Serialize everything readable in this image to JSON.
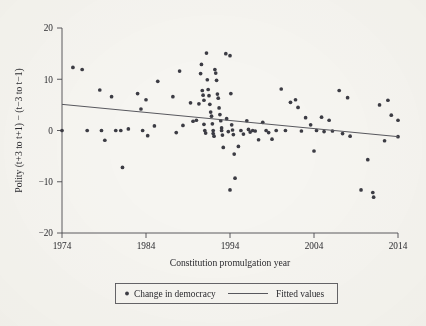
{
  "chart_data": {
    "type": "scatter",
    "title": "",
    "xlabel": "Constitution promulgation year",
    "ylabel": "Polity (t+3 to t+1) − (t−3 to t−1)",
    "xlim": [
      1974,
      2014
    ],
    "ylim": [
      -20,
      20
    ],
    "xticks": [
      1974,
      1984,
      1994,
      2004,
      2014
    ],
    "xtick_labels": [
      "1974",
      "1984",
      "1994",
      "2004",
      "2014"
    ],
    "yticks": [
      -20,
      -10,
      0,
      10,
      20
    ],
    "ytick_labels": [
      "−20",
      "−10",
      "0",
      "10",
      "20"
    ],
    "grid": false,
    "legend_position": "bottom-outside",
    "series": [
      {
        "name": "Change in democracy",
        "type": "scatter",
        "marker": "circle",
        "color": "#3c3c44",
        "points": [
          [
            1974.0,
            0.0
          ],
          [
            1975.3,
            12.3
          ],
          [
            1976.4,
            11.9
          ],
          [
            1977.0,
            0.0
          ],
          [
            1978.5,
            7.9
          ],
          [
            1978.7,
            0.0
          ],
          [
            1979.1,
            -1.9
          ],
          [
            1979.9,
            6.6
          ],
          [
            1980.4,
            0.0
          ],
          [
            1981.0,
            0.0
          ],
          [
            1981.2,
            -7.2
          ],
          [
            1981.9,
            0.3
          ],
          [
            1983.0,
            7.2
          ],
          [
            1983.4,
            4.2
          ],
          [
            1983.6,
            0.0
          ],
          [
            1984.0,
            6.0
          ],
          [
            1984.2,
            -1.0
          ],
          [
            1985.0,
            0.9
          ],
          [
            1985.4,
            9.6
          ],
          [
            1987.2,
            6.6
          ],
          [
            1987.6,
            -0.4
          ],
          [
            1988.0,
            11.6
          ],
          [
            1988.4,
            1.0
          ],
          [
            1989.3,
            5.4
          ],
          [
            1989.6,
            1.8
          ],
          [
            1990.0,
            2.0
          ],
          [
            1990.3,
            5.2
          ],
          [
            1990.5,
            11.1
          ],
          [
            1990.6,
            12.9
          ],
          [
            1990.7,
            7.8
          ],
          [
            1990.8,
            6.9
          ],
          [
            1990.9,
            5.9
          ],
          [
            1990.9,
            1.2
          ],
          [
            1991.0,
            0.0
          ],
          [
            1991.1,
            -0.5
          ],
          [
            1991.2,
            15.1
          ],
          [
            1991.3,
            9.9
          ],
          [
            1991.4,
            8.0
          ],
          [
            1991.5,
            6.8
          ],
          [
            1991.6,
            5.1
          ],
          [
            1991.7,
            3.6
          ],
          [
            1991.8,
            2.8
          ],
          [
            1991.9,
            1.3
          ],
          [
            1992.0,
            0.0
          ],
          [
            1992.0,
            -0.6
          ],
          [
            1992.1,
            -1.1
          ],
          [
            1992.2,
            11.9
          ],
          [
            1992.3,
            11.2
          ],
          [
            1992.4,
            9.8
          ],
          [
            1992.5,
            7.1
          ],
          [
            1992.6,
            6.3
          ],
          [
            1992.7,
            4.4
          ],
          [
            1992.8,
            3.1
          ],
          [
            1992.9,
            1.9
          ],
          [
            1993.0,
            0.5
          ],
          [
            1993.0,
            0.0
          ],
          [
            1993.1,
            -0.9
          ],
          [
            1993.2,
            -3.3
          ],
          [
            1993.5,
            15.0
          ],
          [
            1993.6,
            2.3
          ],
          [
            1993.8,
            -0.2
          ],
          [
            1994.0,
            14.6
          ],
          [
            1994.1,
            7.2
          ],
          [
            1994.2,
            1.1
          ],
          [
            1994.3,
            0.1
          ],
          [
            1994.4,
            -0.8
          ],
          [
            1994.5,
            -4.6
          ],
          [
            1994.6,
            -9.3
          ],
          [
            1994.0,
            -11.6
          ],
          [
            1995.0,
            -3.1
          ],
          [
            1995.3,
            0.0
          ],
          [
            1995.6,
            -0.7
          ],
          [
            1996.0,
            1.9
          ],
          [
            1996.2,
            0.2
          ],
          [
            1996.4,
            -0.3
          ],
          [
            1996.7,
            0.0
          ],
          [
            1997.0,
            -0.1
          ],
          [
            1997.4,
            -1.8
          ],
          [
            1997.9,
            1.6
          ],
          [
            1998.3,
            0.0
          ],
          [
            1998.6,
            -0.4
          ],
          [
            1999.0,
            -1.7
          ],
          [
            1999.5,
            0.0
          ],
          [
            2000.1,
            8.1
          ],
          [
            2000.6,
            0.0
          ],
          [
            2001.2,
            5.5
          ],
          [
            2001.8,
            6.0
          ],
          [
            2002.1,
            4.5
          ],
          [
            2002.5,
            -0.1
          ],
          [
            2003.0,
            2.5
          ],
          [
            2003.6,
            1.1
          ],
          [
            2004.0,
            -4.0
          ],
          [
            2004.3,
            0.0
          ],
          [
            2004.9,
            2.6
          ],
          [
            2005.2,
            -0.2
          ],
          [
            2005.8,
            2.0
          ],
          [
            2006.2,
            -0.1
          ],
          [
            2007.0,
            7.8
          ],
          [
            2007.4,
            -0.6
          ],
          [
            2008.0,
            6.4
          ],
          [
            2008.3,
            -1.1
          ],
          [
            2009.6,
            -11.6
          ],
          [
            2010.4,
            -5.7
          ],
          [
            2011.0,
            -12.1
          ],
          [
            2011.1,
            -13.0
          ],
          [
            2011.8,
            5.0
          ],
          [
            2012.4,
            -2.0
          ],
          [
            2012.8,
            5.9
          ],
          [
            2013.2,
            3.0
          ],
          [
            2014.0,
            2.0
          ],
          [
            2014.0,
            -1.2
          ]
        ]
      },
      {
        "name": "Fitted values",
        "type": "line",
        "color": "#58585e",
        "endpoints": [
          [
            1974,
            5.1
          ],
          [
            2014,
            -1.2
          ]
        ]
      }
    ]
  },
  "legend": {
    "items": [
      {
        "label": "Change in democracy",
        "marker": "dot"
      },
      {
        "label": "Fitted values",
        "marker": "line"
      }
    ]
  }
}
